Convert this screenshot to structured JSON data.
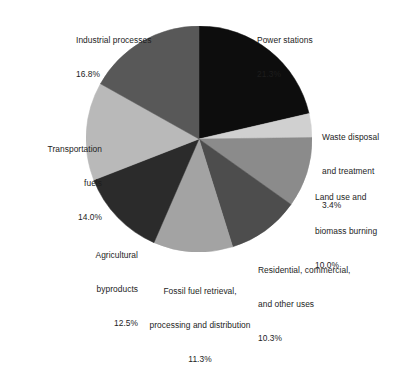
{
  "chart_data": {
    "type": "pie",
    "title": "",
    "subtitle": "",
    "xlabel": "",
    "ylabel": "",
    "legend_position": "none",
    "grid": false,
    "units": "percent",
    "start_angle_deg": 0,
    "direction": "clockwise",
    "categories": [
      "Power stations",
      "Waste disposal and treatment",
      "Land use and biomass burning",
      "Residential, commercial, and other uses",
      "Fossil fuel retrieval, processing and distribution",
      "Agricultural byproducts",
      "Transportation fuels",
      "Industrial processes"
    ],
    "values": [
      21.3,
      3.4,
      10.0,
      10.3,
      11.3,
      12.5,
      14.0,
      16.8
    ],
    "colors": [
      "#0d0d0d",
      "#d0d0d0",
      "#8b8b8b",
      "#4d4d4d",
      "#a3a3a3",
      "#2b2b2b",
      "#b9b9b9",
      "#585858"
    ],
    "slices": [
      {
        "name": "Power stations",
        "value": 21.3,
        "color": "#0d0d0d"
      },
      {
        "name": "Waste disposal and treatment",
        "value": 3.4,
        "color": "#d0d0d0"
      },
      {
        "name": "Land use and biomass burning",
        "value": 10.0,
        "color": "#8b8b8b"
      },
      {
        "name": "Residential, commercial, and other uses",
        "value": 10.3,
        "color": "#4d4d4d"
      },
      {
        "name": "Fossil fuel retrieval, processing and distribution",
        "value": 11.3,
        "color": "#a3a3a3"
      },
      {
        "name": "Agricultural byproducts",
        "value": 12.5,
        "color": "#2b2b2b"
      },
      {
        "name": "Transportation fuels",
        "value": 14.0,
        "color": "#b9b9b9"
      },
      {
        "name": "Industrial processes",
        "value": 16.8,
        "color": "#585858"
      }
    ]
  },
  "labels": {
    "industrial": {
      "name": "Industrial processes",
      "pct": "16.8%"
    },
    "power": {
      "name": "Power stations",
      "pct": "21.3%"
    },
    "waste": {
      "line1": "Waste disposal",
      "line2": "and treatment",
      "pct": "3.4%"
    },
    "land": {
      "line1": "Land use and",
      "line2": "biomass burning",
      "pct": "10.0%"
    },
    "residential": {
      "line1": "Residential, commercial,",
      "line2": "and other uses",
      "pct": "10.3%"
    },
    "fossil": {
      "line1": "Fossil fuel retrieval,",
      "line2": "processing and distribution",
      "pct": "11.3%"
    },
    "agricultural": {
      "line1": "Agricultural",
      "line2": "byproducts",
      "pct": "12.5%"
    },
    "transportation": {
      "line1": "Transportation",
      "line2": "fuels",
      "pct": "14.0%"
    }
  },
  "style": {
    "background": "#ffffff",
    "text_color": "#1d1d1d"
  }
}
